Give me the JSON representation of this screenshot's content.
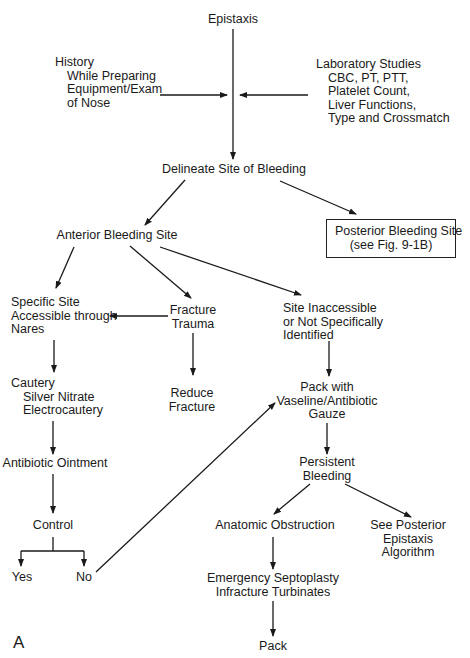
{
  "figure": {
    "panel_label": "A",
    "nodes": {
      "epistaxis": [
        "Epistaxis"
      ],
      "history": [
        "History",
        "While Preparing",
        "Equipment/Exam",
        "of Nose"
      ],
      "lab_studies": [
        "Laboratory Studies",
        "CBC, PT, PTT,",
        "Platelet Count,",
        "Liver Functions,",
        "Type and Crossmatch"
      ],
      "delineate": [
        "Delineate Site of Bleeding"
      ],
      "posterior": [
        "Posterior Bleeding Site",
        "(see Fig. 9-1B)"
      ],
      "anterior": [
        "Anterior Bleeding Site"
      ],
      "specific_site": [
        "Specific Site",
        "Accessible through",
        "Nares"
      ],
      "fracture": [
        "Fracture",
        "Trauma"
      ],
      "inaccessible": [
        "Site Inaccessible",
        "or Not Specifically",
        "Identified"
      ],
      "cautery": [
        "Cautery",
        "Silver Nitrate",
        "Electrocautery"
      ],
      "reduce": [
        "Reduce",
        "Fracture"
      ],
      "pack_vaseline": [
        "Pack with",
        "Vaseline/Antibiotic",
        "Gauze"
      ],
      "antibiotic": [
        "Antibiotic Ointment"
      ],
      "persistent": [
        "Persistent",
        "Bleeding"
      ],
      "control": [
        "Control"
      ],
      "anatomic": [
        "Anatomic Obstruction"
      ],
      "see_posterior": [
        "See Posterior",
        "Epistaxis",
        "Algorithm"
      ],
      "yes": [
        "Yes"
      ],
      "no": [
        "No"
      ],
      "septoplasty": [
        "Emergency Septoplasty",
        "Infracture Turbinates"
      ],
      "pack": [
        "Pack"
      ]
    },
    "edges": [
      {
        "from": "epistaxis",
        "to": "delineate"
      },
      {
        "from": "history",
        "to": "epistaxis-delineate-line"
      },
      {
        "from": "lab_studies",
        "to": "epistaxis-delineate-line"
      },
      {
        "from": "delineate",
        "to": "anterior"
      },
      {
        "from": "delineate",
        "to": "posterior"
      },
      {
        "from": "anterior",
        "to": "specific_site"
      },
      {
        "from": "anterior",
        "to": "fracture"
      },
      {
        "from": "anterior",
        "to": "inaccessible"
      },
      {
        "from": "fracture",
        "to": "specific_site"
      },
      {
        "from": "fracture",
        "to": "reduce"
      },
      {
        "from": "specific_site",
        "to": "cautery"
      },
      {
        "from": "inaccessible",
        "to": "pack_vaseline"
      },
      {
        "from": "cautery",
        "to": "antibiotic"
      },
      {
        "from": "antibiotic",
        "to": "control"
      },
      {
        "from": "control",
        "to": "yes"
      },
      {
        "from": "control",
        "to": "no"
      },
      {
        "from": "no",
        "to": "pack_vaseline"
      },
      {
        "from": "pack_vaseline",
        "to": "persistent"
      },
      {
        "from": "persistent",
        "to": "anatomic"
      },
      {
        "from": "persistent",
        "to": "see_posterior"
      },
      {
        "from": "anatomic",
        "to": "septoplasty"
      },
      {
        "from": "septoplasty",
        "to": "pack"
      }
    ]
  }
}
